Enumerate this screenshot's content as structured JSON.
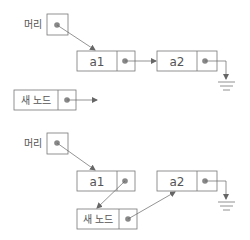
{
  "caption": "그림 5-5 연결 리스트에 노드 삽입하기",
  "colors": {
    "stroke": "#777777",
    "dot": "#888888",
    "arrow": "#666666",
    "text": "#555555",
    "box_fill": "#ffffff"
  },
  "diagrams": [
    {
      "name": "before-insert",
      "head": {
        "label": "머리"
      },
      "nodes": [
        {
          "id": "a1",
          "label": "a1"
        },
        {
          "id": "a2",
          "label": "a2"
        },
        {
          "id": "new",
          "label": "새 노드"
        }
      ],
      "links": [
        {
          "from": "head",
          "to": "a1"
        },
        {
          "from": "a1",
          "to": "a2"
        },
        {
          "from": "a2",
          "to": "null-ground"
        },
        {
          "from": "new",
          "to": "dangling"
        }
      ]
    },
    {
      "name": "after-insert",
      "head": {
        "label": "머리"
      },
      "nodes": [
        {
          "id": "a1",
          "label": "a1"
        },
        {
          "id": "a2",
          "label": "a2"
        },
        {
          "id": "new",
          "label": "새 노드"
        }
      ],
      "links": [
        {
          "from": "head",
          "to": "a1"
        },
        {
          "from": "a1",
          "to": "new"
        },
        {
          "from": "new",
          "to": "a2"
        },
        {
          "from": "a2",
          "to": "null-ground"
        }
      ]
    }
  ]
}
